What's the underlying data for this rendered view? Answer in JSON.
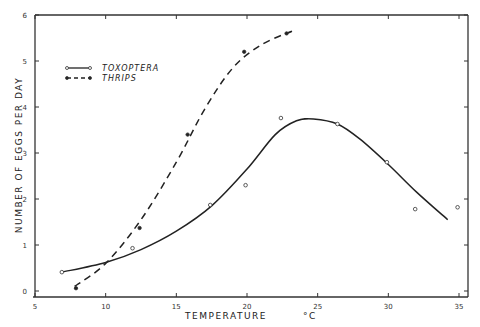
{
  "chart_data": {
    "type": "line",
    "title": "",
    "xlabel": "TEMPERATURE °C",
    "ylabel": "NUMBER OF EGGS PER DAY",
    "xlim": [
      5,
      35
    ],
    "ylim": [
      0,
      6
    ],
    "xticks": [
      5,
      10,
      15,
      20,
      25,
      30,
      35
    ],
    "yticks": [
      0,
      1,
      2,
      3,
      4,
      5,
      6
    ],
    "grid": false,
    "legend_position": "upper-left",
    "series": [
      {
        "name": "TOXOPTERA",
        "marker": "open-circle",
        "line": "solid",
        "points": [
          {
            "x": 6.9,
            "y": 0.41
          },
          {
            "x": 11.9,
            "y": 0.93
          },
          {
            "x": 17.4,
            "y": 1.87
          },
          {
            "x": 19.9,
            "y": 2.3
          },
          {
            "x": 22.4,
            "y": 3.76
          },
          {
            "x": 26.4,
            "y": 3.63
          },
          {
            "x": 29.9,
            "y": 2.8
          },
          {
            "x": 31.9,
            "y": 1.78
          },
          {
            "x": 34.9,
            "y": 1.82
          }
        ],
        "fitted_curve": [
          {
            "x": 6.9,
            "y": 0.41
          },
          {
            "x": 10,
            "y": 0.62
          },
          {
            "x": 12.5,
            "y": 0.9
          },
          {
            "x": 15,
            "y": 1.3
          },
          {
            "x": 17.5,
            "y": 1.85
          },
          {
            "x": 20,
            "y": 2.65
          },
          {
            "x": 22,
            "y": 3.4
          },
          {
            "x": 23.5,
            "y": 3.7
          },
          {
            "x": 24.7,
            "y": 3.74
          },
          {
            "x": 26.4,
            "y": 3.63
          },
          {
            "x": 28,
            "y": 3.3
          },
          {
            "x": 30,
            "y": 2.75
          },
          {
            "x": 32,
            "y": 2.15
          },
          {
            "x": 34.2,
            "y": 1.55
          }
        ]
      },
      {
        "name": "THRIPS",
        "marker": "filled-circle",
        "line": "dashed",
        "points": [
          {
            "x": 7.9,
            "y": 0.06
          },
          {
            "x": 12.4,
            "y": 1.37
          },
          {
            "x": 15.8,
            "y": 3.4
          },
          {
            "x": 19.8,
            "y": 5.2
          },
          {
            "x": 22.8,
            "y": 5.6
          }
        ],
        "fitted_curve": [
          {
            "x": 7.8,
            "y": 0.1
          },
          {
            "x": 10,
            "y": 0.6
          },
          {
            "x": 12.5,
            "y": 1.55
          },
          {
            "x": 15,
            "y": 2.8
          },
          {
            "x": 17,
            "y": 3.95
          },
          {
            "x": 19,
            "y": 4.85
          },
          {
            "x": 21,
            "y": 5.35
          },
          {
            "x": 23.2,
            "y": 5.65
          }
        ]
      }
    ]
  },
  "legend": {
    "items": [
      {
        "label": "TOXOPTERA",
        "style": "solid-open"
      },
      {
        "label": "THRIPS",
        "style": "dashed-filled"
      }
    ]
  },
  "axes": {
    "x_title": "TEMPERATURE",
    "x_unit": "°C",
    "y_title": "NUMBER  OF  EGGS  PER  DAY"
  }
}
